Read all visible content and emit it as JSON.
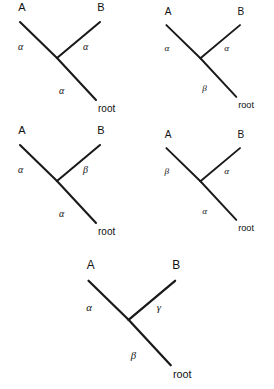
{
  "figure": {
    "background_color": "#ffffff",
    "line_color": "#1a1a1a",
    "text_color": "#111111",
    "panel_count": 5,
    "layout": "2 columns x 2 rows, plus 1 centered bottom panel"
  },
  "panels": [
    {
      "id": "panel-top-left",
      "position": {
        "x": 0,
        "y": 0,
        "width": 137,
        "height": 122
      },
      "tips": [
        {
          "name": "A",
          "label": "A",
          "x": 22,
          "y": 11
        },
        {
          "name": "B",
          "label": "B",
          "x": 101,
          "y": 11
        }
      ],
      "root": {
        "label": "root",
        "x": 98,
        "y": 112
      },
      "branches": [
        {
          "name": "branch-A",
          "label": "α",
          "label_x": 18,
          "label_y": 50
        },
        {
          "name": "branch-B",
          "label": "α",
          "label_x": 83,
          "label_y": 50
        },
        {
          "name": "branch-root",
          "label": "α",
          "label_x": 59,
          "label_y": 94
        }
      ]
    },
    {
      "id": "panel-top-right",
      "position": {
        "x": 148,
        "y": 0,
        "width": 126,
        "height": 122
      },
      "tips": [
        {
          "name": "A",
          "label": "A",
          "x": 22,
          "y": 11
        },
        {
          "name": "B",
          "label": "B",
          "x": 101,
          "y": 11
        }
      ],
      "root": {
        "label": "root",
        "x": 98,
        "y": 112
      },
      "branches": [
        {
          "name": "branch-A",
          "label": "α",
          "label_x": 18,
          "label_y": 50
        },
        {
          "name": "branch-B",
          "label": "α",
          "label_x": 83,
          "label_y": 50
        },
        {
          "name": "branch-root",
          "label": "β",
          "label_x": 59,
          "label_y": 94
        }
      ]
    },
    {
      "id": "panel-middle-left",
      "position": {
        "x": 0,
        "y": 123,
        "width": 137,
        "height": 122
      },
      "tips": [
        {
          "name": "A",
          "label": "A",
          "x": 22,
          "y": 11
        },
        {
          "name": "B",
          "label": "B",
          "x": 101,
          "y": 11
        }
      ],
      "root": {
        "label": "root",
        "x": 98,
        "y": 112
      },
      "branches": [
        {
          "name": "branch-A",
          "label": "α",
          "label_x": 18,
          "label_y": 50
        },
        {
          "name": "branch-B",
          "label": "β",
          "label_x": 83,
          "label_y": 50
        },
        {
          "name": "branch-root",
          "label": "α",
          "label_x": 59,
          "label_y": 94
        }
      ]
    },
    {
      "id": "panel-middle-right",
      "position": {
        "x": 148,
        "y": 123,
        "width": 126,
        "height": 122
      },
      "tips": [
        {
          "name": "A",
          "label": "A",
          "x": 22,
          "y": 11
        },
        {
          "name": "B",
          "label": "B",
          "x": 101,
          "y": 11
        }
      ],
      "root": {
        "label": "root",
        "x": 98,
        "y": 112
      },
      "branches": [
        {
          "name": "branch-A",
          "label": "β",
          "label_x": 18,
          "label_y": 50
        },
        {
          "name": "branch-B",
          "label": "α",
          "label_x": 83,
          "label_y": 50
        },
        {
          "name": "branch-root",
          "label": "α",
          "label_x": 59,
          "label_y": 94
        }
      ]
    },
    {
      "id": "panel-bottom-center",
      "position": {
        "x": 66,
        "y": 257,
        "width": 150,
        "height": 132
      },
      "tips": [
        {
          "name": "A",
          "label": "A",
          "x": 22,
          "y": 11
        },
        {
          "name": "B",
          "label": "B",
          "x": 101,
          "y": 11
        }
      ],
      "root": {
        "label": "root",
        "x": 98,
        "y": 112
      },
      "branches": [
        {
          "name": "branch-A",
          "label": "α",
          "label_x": 18,
          "label_y": 50
        },
        {
          "name": "branch-B",
          "label": "γ",
          "label_x": 83,
          "label_y": 50
        },
        {
          "name": "branch-root",
          "label": "β",
          "label_x": 59,
          "label_y": 94
        }
      ]
    }
  ],
  "geometry": {
    "tip_a_end": {
      "x": 20,
      "y": 22
    },
    "tip_b_end": {
      "x": 100,
      "y": 22
    },
    "junction": {
      "x": 57,
      "y": 58
    },
    "root_end": {
      "x": 96,
      "y": 100
    }
  }
}
